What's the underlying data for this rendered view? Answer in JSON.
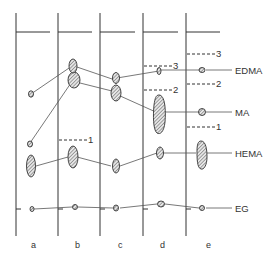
{
  "diagram": {
    "type": "chromatogram",
    "lanes": [
      {
        "id": "a",
        "label": "a"
      },
      {
        "id": "b",
        "label": "b"
      },
      {
        "id": "c",
        "label": "c"
      },
      {
        "id": "d",
        "label": "d"
      },
      {
        "id": "e",
        "label": "e"
      }
    ],
    "compounds": [
      {
        "id": "edma",
        "label": "EDMA"
      },
      {
        "id": "ma",
        "label": "MA"
      },
      {
        "id": "hema",
        "label": "HEMA"
      },
      {
        "id": "eg",
        "label": "EG"
      }
    ],
    "markers": {
      "d3": "3",
      "d2": "2",
      "b1": "1",
      "e3": "3",
      "e2": "2",
      "e1": "1"
    },
    "colors": {
      "line": "#333333",
      "spot_fill": "#bbbbbb"
    }
  }
}
